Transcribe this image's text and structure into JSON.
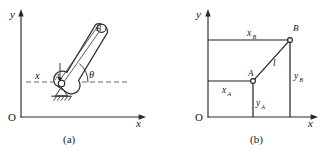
{
  "figure": {
    "panels": [
      {
        "id": "a",
        "caption": "(a)",
        "axes": {
          "origin_label": "O",
          "x_label": "x",
          "y_label": "y"
        },
        "labels": {
          "rod_top": "B",
          "pivot": "A",
          "offset": "x",
          "angle": "θ"
        },
        "elements": [
          "y-axis",
          "x-axis",
          "horizontal-reference-dashed-line",
          "inclined-rod",
          "rod-centerline",
          "pin-support",
          "ground-hatching",
          "angle-arc"
        ]
      },
      {
        "id": "b",
        "caption": "(b)",
        "axes": {
          "origin_label": "O",
          "x_label": "x",
          "y_label": "y"
        },
        "labels": {
          "point_a": "A",
          "point_b": "B",
          "length": "l",
          "x_a_base": "x",
          "x_a_sub": "A",
          "y_a_base": "y",
          "y_a_sub": "A",
          "x_b_base": "x",
          "x_b_sub": "B",
          "y_b_base": "y",
          "y_b_sub": "B"
        },
        "elements": [
          "y-axis",
          "x-axis",
          "horizontal-line-through-A",
          "horizontal-line-through-B",
          "vertical-line-through-A",
          "vertical-line-through-B",
          "segment-AB",
          "node-A",
          "node-B"
        ]
      }
    ],
    "colors": {
      "ink": "#1f1e22",
      "line": "#2b2a2e",
      "light_line": "#55545a",
      "background": "#ffffff"
    }
  }
}
